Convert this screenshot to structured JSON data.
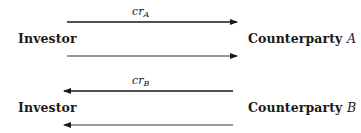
{
  "diagram": {
    "rows": [
      {
        "left_node": "Investor",
        "right_node_text": "Counterparty",
        "right_node_var": "A",
        "top_arrow": {
          "direction": "right",
          "label_main": "cr",
          "label_sub": "A"
        },
        "bottom_arrow": {
          "direction": "right",
          "label_main": "",
          "label_sub": ""
        }
      },
      {
        "left_node": "Investor",
        "right_node_text": "Counterparty",
        "right_node_var": "B",
        "top_arrow": {
          "direction": "left",
          "label_main": "cr",
          "label_sub": "B"
        },
        "bottom_arrow": {
          "direction": "left",
          "label_main": "",
          "label_sub": ""
        }
      }
    ],
    "colors": {
      "line": "#1a1a1a",
      "text": "#1a1a1a"
    }
  }
}
